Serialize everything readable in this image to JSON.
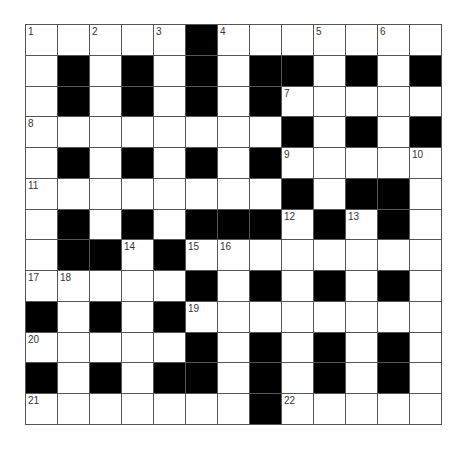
{
  "puzzle": {
    "rows": 13,
    "cols": 13,
    "colors": {
      "block": "#000000",
      "empty": "#ffffff",
      "grid_line": "#555555",
      "number_text": "#333333"
    },
    "layout": [
      "WWWWWBWWWWWWW",
      "WBWBWBWBBWBWB",
      "WBWBWBWBWWWWW",
      "WWWWWWWWBWBWB",
      "WBWBWBWBWWWWW",
      "WWWWWWWWBWBBW",
      "WBWBWBBBWBWBW",
      "WBBWBWWWWWWWW",
      "WWWWWBWBWBWBW",
      "BWBWBWWWWWWWW",
      "WWWWWBWBWBWBW",
      "BWBWBBWBWBWBW",
      "WWWWWWWBWWWWW"
    ],
    "numbers": [
      {
        "row": 0,
        "col": 0,
        "n": "1"
      },
      {
        "row": 0,
        "col": 2,
        "n": "2"
      },
      {
        "row": 0,
        "col": 4,
        "n": "3"
      },
      {
        "row": 0,
        "col": 6,
        "n": "4"
      },
      {
        "row": 0,
        "col": 9,
        "n": "5"
      },
      {
        "row": 0,
        "col": 11,
        "n": "6"
      },
      {
        "row": 2,
        "col": 8,
        "n": "7"
      },
      {
        "row": 3,
        "col": 0,
        "n": "8"
      },
      {
        "row": 4,
        "col": 8,
        "n": "9"
      },
      {
        "row": 4,
        "col": 12,
        "n": "10"
      },
      {
        "row": 5,
        "col": 0,
        "n": "11"
      },
      {
        "row": 6,
        "col": 8,
        "n": "12"
      },
      {
        "row": 6,
        "col": 10,
        "n": "13"
      },
      {
        "row": 7,
        "col": 3,
        "n": "14"
      },
      {
        "row": 7,
        "col": 5,
        "n": "15"
      },
      {
        "row": 7,
        "col": 6,
        "n": "16"
      },
      {
        "row": 8,
        "col": 0,
        "n": "17"
      },
      {
        "row": 8,
        "col": 1,
        "n": "18"
      },
      {
        "row": 9,
        "col": 5,
        "n": "19"
      },
      {
        "row": 10,
        "col": 0,
        "n": "20"
      },
      {
        "row": 12,
        "col": 0,
        "n": "21"
      },
      {
        "row": 12,
        "col": 8,
        "n": "22"
      }
    ]
  }
}
